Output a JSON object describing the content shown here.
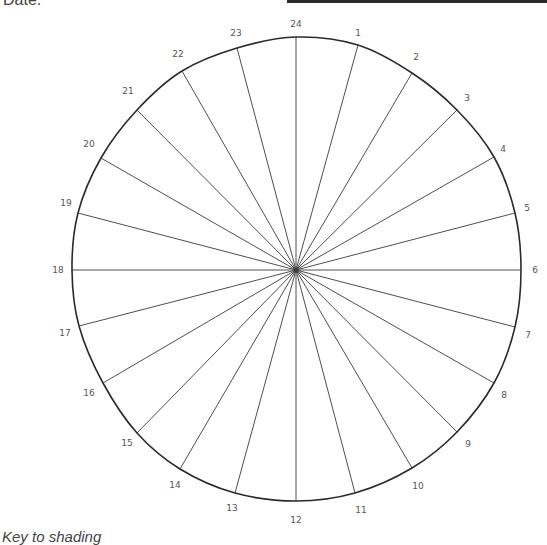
{
  "header": {
    "date_label": "Date:"
  },
  "footer": {
    "key_label": "Key to shading"
  },
  "clock": {
    "center": [
      296,
      270
    ],
    "rim_points": [
      [
        296,
        37
      ],
      [
        358,
        45
      ],
      [
        412,
        73
      ],
      [
        457,
        110
      ],
      [
        494,
        157
      ],
      [
        515,
        213
      ],
      [
        521,
        270
      ],
      [
        515,
        327
      ],
      [
        494,
        383
      ],
      [
        457,
        432
      ],
      [
        412,
        468
      ],
      [
        355,
        493
      ],
      [
        296,
        501
      ],
      [
        235,
        493
      ],
      [
        180,
        469
      ],
      [
        137,
        433
      ],
      [
        103,
        383
      ],
      [
        79,
        326
      ],
      [
        72,
        270
      ],
      [
        78,
        213
      ],
      [
        101,
        158
      ],
      [
        137,
        110
      ],
      [
        182,
        71
      ],
      [
        237,
        48
      ]
    ],
    "hours": [
      {
        "label": "24",
        "x": 296,
        "y": 24
      },
      {
        "label": "1",
        "x": 358,
        "y": 33
      },
      {
        "label": "2",
        "x": 416,
        "y": 57
      },
      {
        "label": "3",
        "x": 467,
        "y": 98
      },
      {
        "label": "4",
        "x": 503,
        "y": 149
      },
      {
        "label": "5",
        "x": 527,
        "y": 208
      },
      {
        "label": "6",
        "x": 535,
        "y": 270
      },
      {
        "label": "7",
        "x": 528,
        "y": 335
      },
      {
        "label": "8",
        "x": 504,
        "y": 395
      },
      {
        "label": "9",
        "x": 468,
        "y": 444
      },
      {
        "label": "10",
        "x": 418,
        "y": 486
      },
      {
        "label": "11",
        "x": 361,
        "y": 510
      },
      {
        "label": "12",
        "x": 296,
        "y": 520
      },
      {
        "label": "13",
        "x": 232,
        "y": 508
      },
      {
        "label": "14",
        "x": 175,
        "y": 485
      },
      {
        "label": "15",
        "x": 127,
        "y": 443
      },
      {
        "label": "16",
        "x": 89,
        "y": 393
      },
      {
        "label": "17",
        "x": 65,
        "y": 333
      },
      {
        "label": "18",
        "x": 58,
        "y": 270
      },
      {
        "label": "19",
        "x": 66,
        "y": 203
      },
      {
        "label": "20",
        "x": 89,
        "y": 144
      },
      {
        "label": "21",
        "x": 128,
        "y": 91
      },
      {
        "label": "22",
        "x": 178,
        "y": 54
      },
      {
        "label": "23",
        "x": 236,
        "y": 33
      }
    ]
  }
}
